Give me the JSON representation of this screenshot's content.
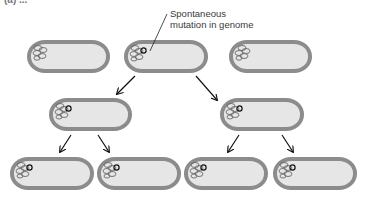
{
  "figure": {
    "cut_label": "(a) ...",
    "annotation": {
      "line1": "Spontaneous",
      "line2": "mutation in genome"
    },
    "colors": {
      "cell_wall": "#8c8c8c",
      "cell_fill": "#e6e6e6",
      "genome": "#6a6a6a",
      "mutation": "#111111",
      "arrow": "#111111"
    },
    "generations": [
      {
        "name": "parent",
        "cells": [
          {
            "id": "top-1",
            "mutated": false
          },
          {
            "id": "top-2",
            "mutated": true
          },
          {
            "id": "top-3",
            "mutated": false
          }
        ]
      },
      {
        "name": "first-division",
        "cells": [
          {
            "id": "mid-1",
            "mutated": true
          },
          {
            "id": "mid-2",
            "mutated": true
          }
        ]
      },
      {
        "name": "second-division",
        "cells": [
          {
            "id": "bot-1",
            "mutated": true
          },
          {
            "id": "bot-2",
            "mutated": true
          },
          {
            "id": "bot-3",
            "mutated": true
          },
          {
            "id": "bot-4",
            "mutated": true
          }
        ]
      }
    ]
  }
}
